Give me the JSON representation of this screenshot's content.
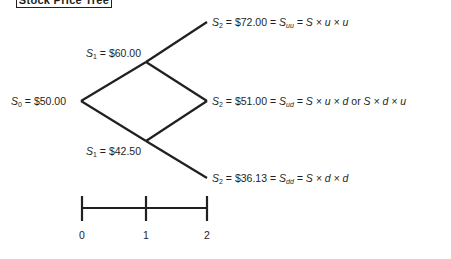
{
  "title": "Stock Price Tree",
  "nodes": {
    "s0": {
      "sym": "S",
      "sub": "0",
      "eq": " = $50.00"
    },
    "s1_up": {
      "sym": "S",
      "sub": "1",
      "eq": " = $60.00"
    },
    "s1_down": {
      "sym": "S",
      "sub": "1",
      "eq": " = $42.50"
    },
    "s2_uu": {
      "sym": "S",
      "sub": "2",
      "eq": " = $72.00 = ",
      "sym2": "S",
      "sub2": "uu",
      "formula": " = S × u × u"
    },
    "s2_ud": {
      "sym": "S",
      "sub": "2",
      "eq": " = $51.00 = ",
      "sym2": "S",
      "sub2": "ud",
      "formula": " = S × u × d",
      "or": " or ",
      "formula2": "S × d × u"
    },
    "s2_dd": {
      "sym": "S",
      "sub": "2",
      "eq": " = $36.13 = ",
      "sym2": "S",
      "sub2": "dd",
      "formula": " = S × d × d"
    }
  },
  "timeline": {
    "ticks": [
      "0",
      "1",
      "2"
    ]
  },
  "colors": {
    "line": "#231f20",
    "background": "#ffffff"
  }
}
